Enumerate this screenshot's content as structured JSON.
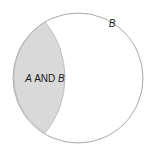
{
  "figure": {
    "type": "venn-diagram",
    "width": 154,
    "height": 153,
    "background_color": "#ffffff"
  },
  "colors": {
    "background": "#ffffff",
    "circle_stroke": "#a8a8a8",
    "circle_fill": "#ffffff",
    "intersection_fill": "#d9d9d9",
    "intersection_stroke": "#b5b5b5",
    "text": "#1a1a1a"
  },
  "circle_b": {
    "name": "B",
    "center_x": 78,
    "center_y": 78,
    "radius": 65,
    "stroke_width": 1,
    "fill": "#ffffff"
  },
  "circle_a": {
    "name": "A",
    "center_x": -12,
    "center_y": 78,
    "radius": 87,
    "drawn": false
  },
  "intersection_region": {
    "name": "A AND B",
    "shape": "lens",
    "left_x": 9,
    "right_x": 75,
    "top_point_x": 45,
    "top_point_y": 22,
    "bottom_point_x": 45,
    "bottom_point_y": 133,
    "fill": "#d9d9d9"
  },
  "labels": {
    "intersection": {
      "full_text": "A AND B",
      "part_a": "A",
      "part_operator": "AND",
      "part_b": "B",
      "x": 45,
      "y": 79,
      "font_size": 10
    },
    "circle_b": {
      "text": "B",
      "x": 112,
      "y": 26,
      "font_size": 10
    }
  }
}
